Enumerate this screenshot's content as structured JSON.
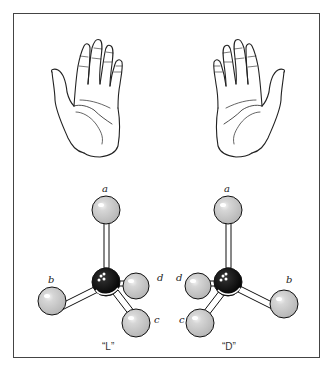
{
  "figure": {
    "top_row": {
      "left_hand": "left-hand",
      "right_hand": "right-hand"
    },
    "molecules": {
      "left": {
        "caption": "“L”",
        "labels": {
          "a": "a",
          "b": "b",
          "c": "c",
          "d": "d"
        }
      },
      "right": {
        "caption": "“D”",
        "labels": {
          "a": "a",
          "b": "b",
          "c": "c",
          "d": "d"
        }
      }
    },
    "colors": {
      "frame": "#444444",
      "substituent_atom": "#c8c8c8",
      "central_atom": "#000000",
      "bond": "#ffffff",
      "outline": "#111111"
    }
  }
}
